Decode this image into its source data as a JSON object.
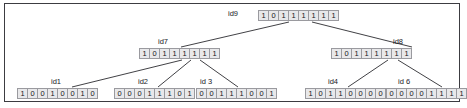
{
  "diagram": {
    "border_color": "#3c3c41",
    "background_color": "#ffffff",
    "cell_fill": "#e8e8ea",
    "cell_border": "#9a9a9f",
    "edge_color": "#2b2b30",
    "nodes": [
      {
        "id": "id9",
        "label": "id9",
        "bits": [
          "1",
          "0",
          "1",
          "1",
          "1",
          "1",
          "1",
          "1"
        ],
        "bitstring": "10111111",
        "level": "root",
        "x": 258,
        "y": 10,
        "label_x": 228,
        "label_y": 9
      },
      {
        "id": "id7",
        "label": "id7",
        "bits": [
          "1",
          "0",
          "1",
          "1",
          "1",
          "1",
          "1",
          "1"
        ],
        "bitstring": "10111111",
        "level": "internal",
        "x": 139,
        "y": 48,
        "label_x": 158,
        "label_y": 37
      },
      {
        "id": "id8",
        "label": "id8",
        "bits": [
          "1",
          "0",
          "1",
          "1",
          "1",
          "1",
          "1",
          "1"
        ],
        "bitstring": "10111111",
        "level": "internal",
        "x": 331,
        "y": 48,
        "label_x": 393,
        "label_y": 37
      },
      {
        "id": "id1",
        "label": "id1",
        "bits": [
          "1",
          "0",
          "0",
          "1",
          "0",
          "0",
          "1",
          "0"
        ],
        "bitstring": "10010010",
        "level": "leaf",
        "x": 17,
        "y": 88,
        "label_x": 51,
        "label_y": 77
      },
      {
        "id": "id2",
        "label": "id2",
        "bits": [
          "0",
          "0",
          "0",
          "1",
          "1",
          "1",
          "0",
          "1"
        ],
        "bitstring": "00011101",
        "level": "leaf",
        "x": 114,
        "y": 88,
        "label_x": 138,
        "label_y": 77
      },
      {
        "id": "id3",
        "label": "id 3",
        "bits": [
          "0",
          "0",
          "1",
          "1",
          "1",
          "0",
          "0",
          "1"
        ],
        "bitstring": "00111001",
        "level": "leaf",
        "x": 196,
        "y": 88,
        "label_x": 200,
        "label_y": 77
      },
      {
        "id": "id4",
        "label": "id4",
        "bits": [
          "1",
          "0",
          "1",
          "1",
          "0",
          "0",
          "0",
          "0"
        ],
        "bitstring": "10110000",
        "level": "leaf",
        "x": 305,
        "y": 88,
        "label_x": 328,
        "label_y": 77
      },
      {
        "id": "id6",
        "label": "id 6",
        "bits": [
          "0",
          "0",
          "0",
          "0",
          "1",
          "1",
          "1",
          "1"
        ],
        "bitstring": "00001111",
        "level": "leaf",
        "x": 386,
        "y": 88,
        "label_x": 398,
        "label_y": 77
      }
    ],
    "edges": [
      {
        "from": "id9",
        "to": "id7",
        "x1": 289,
        "y1": 22,
        "x2": 181,
        "y2": 47
      },
      {
        "from": "id9",
        "to": "id8",
        "x1": 312,
        "y1": 22,
        "x2": 412,
        "y2": 47
      },
      {
        "from": "id7",
        "to": "id1",
        "x1": 182,
        "y1": 60,
        "x2": 72,
        "y2": 87
      },
      {
        "from": "id7",
        "to": "id2",
        "x1": 191,
        "y1": 60,
        "x2": 158,
        "y2": 87
      },
      {
        "from": "id7",
        "to": "id3",
        "x1": 200,
        "y1": 60,
        "x2": 238,
        "y2": 87
      },
      {
        "from": "id8",
        "to": "id4",
        "x1": 388,
        "y1": 60,
        "x2": 348,
        "y2": 87
      },
      {
        "from": "id8",
        "to": "id6",
        "x1": 398,
        "y1": 60,
        "x2": 442,
        "y2": 87
      }
    ]
  }
}
